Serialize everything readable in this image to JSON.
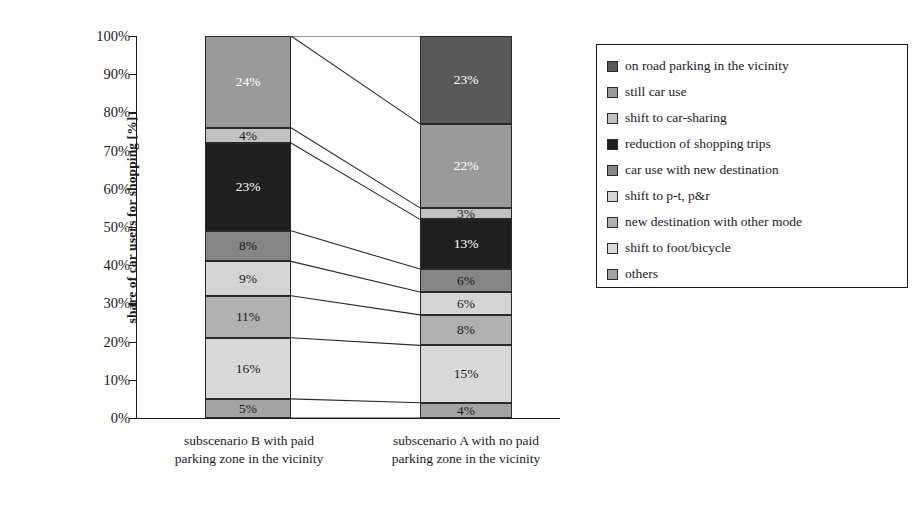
{
  "chart_data": {
    "type": "bar",
    "subtype": "100% stacked bar with category connector lines",
    "title": "",
    "xlabel": "",
    "ylabel": "share of car users for shopping [%]",
    "ylim": [
      0,
      100
    ],
    "ytick_labels": [
      "0%",
      "10%",
      "20%",
      "30%",
      "40%",
      "50%",
      "60%",
      "70%",
      "80%",
      "90%",
      "100%"
    ],
    "ytick_values": [
      0,
      10,
      20,
      30,
      40,
      50,
      60,
      70,
      80,
      90,
      100
    ],
    "grid": false,
    "legend_position": "right",
    "categories": [
      "subscenario B with paid parking zone in the vicinity",
      "subscenario A with no paid parking zone in the vicinity"
    ],
    "category_lines": [
      [
        "subscenario B with paid",
        "parking zone in the vicinity"
      ],
      [
        "subscenario A with no paid",
        "parking zone in the vicinity"
      ]
    ],
    "series": [
      {
        "name": "on road parking in the vicinity",
        "color": "#595959",
        "label_color": "on-dark",
        "values": [
          null,
          23
        ]
      },
      {
        "name": "still car use",
        "color": "#9a9a9a",
        "label_color": "on-dark",
        "values": [
          24,
          22
        ]
      },
      {
        "name": "shift to car-sharing",
        "color": "#c2c2c2",
        "label_color": "on-light",
        "values": [
          4,
          3
        ]
      },
      {
        "name": "reduction of shopping trips",
        "color": "#1f1f1f",
        "label_color": "on-dark",
        "values": [
          23,
          13
        ]
      },
      {
        "name": "car use with new destination",
        "color": "#858585",
        "label_color": "on-light",
        "values": [
          8,
          6
        ]
      },
      {
        "name": "shift to p-t, p&r",
        "color": "#d4d4d4",
        "label_color": "on-light",
        "values": [
          9,
          6
        ]
      },
      {
        "name": "new destination with other mode",
        "color": "#b0b0b0",
        "label_color": "on-light",
        "values": [
          11,
          8
        ]
      },
      {
        "name": "shift to foot/bicycle",
        "color": "#d9d9d9",
        "label_color": "on-light",
        "values": [
          16,
          15
        ]
      },
      {
        "name": "others",
        "color": "#a3a3a3",
        "label_color": "on-light",
        "values": [
          5,
          4
        ]
      }
    ],
    "bar_segment_labels": {
      "subscenario_B": [
        "24%",
        "4%",
        "23%",
        "8%",
        "9%",
        "11%",
        "16%",
        "5%"
      ],
      "subscenario_A": [
        "23%",
        "22%",
        "3%",
        "13%",
        "6%",
        "6%",
        "8%",
        "15%",
        "4%"
      ]
    }
  },
  "legend": {
    "items": [
      "on road parking in the vicinity",
      "still car use",
      "shift to car-sharing",
      "reduction of shopping trips",
      "car use with new destination",
      "shift to p-t, p&r",
      "new destination with other mode",
      "shift to foot/bicycle",
      "others"
    ]
  }
}
